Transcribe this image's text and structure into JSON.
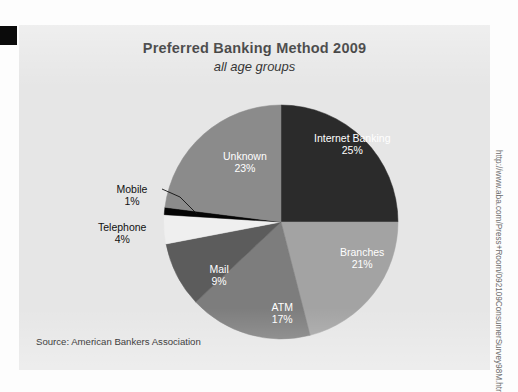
{
  "title": "Preferred Banking Method 2009",
  "subtitle": "all age groups",
  "source": "Source: American Bankers Association",
  "url_caption": "http://www.aba.com/Press+Room/092109ConsumerSurvey98M.htm",
  "chart_data": {
    "type": "pie",
    "title": "Preferred Banking Method 2009",
    "subtitle": "all age groups",
    "categories": [
      "Internet Banking",
      "Branches",
      "ATM",
      "Mail",
      "Telephone",
      "Mobile",
      "Unknown"
    ],
    "values": [
      25,
      21,
      17,
      9,
      4,
      1,
      23
    ],
    "value_labels": [
      "25%",
      "21%",
      "17%",
      "9%",
      "4%",
      "1%",
      "23%"
    ],
    "unit": "%",
    "start_angle_deg": 0,
    "direction": "clockwise",
    "legend": "none",
    "grid": false,
    "slices": [
      {
        "name": "Internet Banking",
        "value": 25,
        "label": "25%",
        "color": "#2b2b2b",
        "text_color": "#ffffff",
        "placement": "inside",
        "label_x": 333,
        "label_y": 119
      },
      {
        "name": "Branches",
        "value": 21,
        "label": "21%",
        "color": "#a3a3a3",
        "text_color": "#ffffff",
        "placement": "inside",
        "label_x": 343,
        "label_y": 233
      },
      {
        "name": "ATM",
        "value": 17,
        "label": "17%",
        "color": "#7d7d7d",
        "text_color": "#ffffff",
        "placement": "inside",
        "label_x": 263,
        "label_y": 288
      },
      {
        "name": "Mail",
        "value": 9,
        "label": "9%",
        "color": "#5c5c5c",
        "text_color": "#ffffff",
        "placement": "inside",
        "label_x": 200,
        "label_y": 250
      },
      {
        "name": "Telephone",
        "value": 4,
        "label": "4%",
        "color": "#efefef",
        "text_color": "#111111",
        "placement": "outside",
        "label_x": 103,
        "label_y": 208
      },
      {
        "name": "Mobile",
        "value": 1,
        "label": "1%",
        "color": "#050505",
        "text_color": "#111111",
        "placement": "outside",
        "label_x": 113,
        "label_y": 170
      },
      {
        "name": "Unknown",
        "value": 23,
        "label": "23%",
        "color": "#8b8b8b",
        "text_color": "#ffffff",
        "placement": "inside",
        "label_x": 226,
        "label_y": 137
      }
    ],
    "geometry": {
      "cx": 262,
      "cy": 197,
      "r": 117
    }
  },
  "colors": {
    "panel_background": "#e6e6e6",
    "page_background": "#fdfdfd",
    "edge_tab": "#0b0b0b",
    "title_text": "#1a1a1a",
    "url_text": "#6d6d6d"
  }
}
